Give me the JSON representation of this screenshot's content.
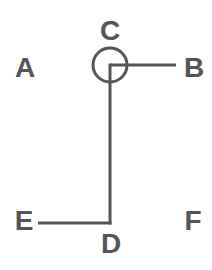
{
  "diagram": {
    "stroke_color": "#555555",
    "background": "#ffffff",
    "labels": {
      "A": "A",
      "B": "B",
      "C": "C",
      "D": "D",
      "E": "E",
      "F": "F"
    },
    "nodes": {
      "circle": {
        "cx": 110,
        "cy": 65,
        "r": 17
      },
      "corner_top": {
        "x": 110,
        "y": 65
      },
      "corner_bottom": {
        "x": 110,
        "y": 223
      }
    },
    "edges": [
      {
        "from": "C",
        "to": "B",
        "x1": 110,
        "y1": 65,
        "x2": 176,
        "y2": 65
      },
      {
        "from": "C",
        "to": "D",
        "x1": 110,
        "y1": 65,
        "x2": 110,
        "y2": 223
      },
      {
        "from": "E",
        "to": "D",
        "x1": 38,
        "y1": 223,
        "x2": 110,
        "y2": 223
      }
    ]
  }
}
